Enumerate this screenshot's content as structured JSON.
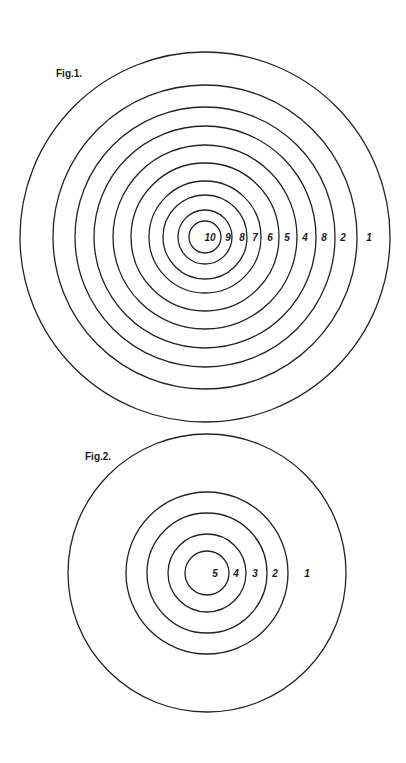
{
  "figures": [
    {
      "label": "Fig.1.",
      "label_pos": [
        56,
        77
      ],
      "center": [
        205,
        237
      ],
      "radii": [
        185,
        152,
        130,
        111,
        92,
        74,
        56,
        42,
        27,
        16
      ],
      "ring_numbers": [
        {
          "text": "10",
          "x": 210
        },
        {
          "text": "9",
          "x": 228
        },
        {
          "text": "8",
          "x": 242
        },
        {
          "text": "7",
          "x": 255
        },
        {
          "text": "6",
          "x": 270
        },
        {
          "text": "5",
          "x": 287
        },
        {
          "text": "4",
          "x": 305
        },
        {
          "text": "8",
          "x": 324
        },
        {
          "text": "2",
          "x": 343
        },
        {
          "text": "1",
          "x": 369
        }
      ]
    },
    {
      "label": "Fig.2.",
      "label_pos": [
        85,
        460
      ],
      "center": [
        207,
        573
      ],
      "radii": [
        139,
        81,
        60,
        39,
        22
      ],
      "ring_numbers": [
        {
          "text": "5",
          "x": 215
        },
        {
          "text": "4",
          "x": 236
        },
        {
          "text": "3",
          "x": 255
        },
        {
          "text": "2",
          "x": 275
        },
        {
          "text": "1",
          "x": 307
        }
      ]
    }
  ]
}
